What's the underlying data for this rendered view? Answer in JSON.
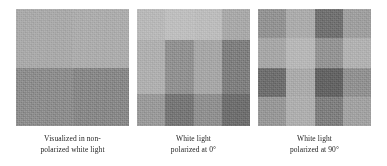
{
  "figure": {
    "panels": [
      {
        "id": "panel-1",
        "name": "nonpolarized-white-light-panel",
        "grid": {
          "cols": 2,
          "rows": 2
        },
        "cells": [
          "#a8a8a8",
          "#ababab",
          "#8b8b8b",
          "#868686"
        ],
        "caption": {
          "line1": "Visualized in non-",
          "line2": "polarized white light"
        }
      },
      {
        "id": "panel-2",
        "name": "white-light-polarized-0deg-panel",
        "grid": {
          "cols": 4,
          "rows": 3
        },
        "cells": [
          "#b7b7b7",
          "#bdbdbd",
          "#bbbbbb",
          "#a7a7a7",
          "#aeaeae",
          "#8f8f8f",
          "#a5a5a5",
          "#7d7d7d",
          "#989898",
          "#757575",
          "#8e8e8e",
          "#6d6d6d"
        ],
        "caption": {
          "line1": "White light",
          "line2": "polarized at 0°"
        }
      },
      {
        "id": "panel-3",
        "name": "white-light-polarized-90deg-panel",
        "grid": {
          "cols": 4,
          "rows": 4
        },
        "cells": [
          "#919191",
          "#aaaaaa",
          "#6f6f6f",
          "#9d9d9d",
          "#a5a5a5",
          "#b6b6b6",
          "#929292",
          "#b0b0b0",
          "#6d6d6d",
          "#a9a9a9",
          "#626262",
          "#8f8f8f",
          "#969696",
          "#adadad",
          "#7d7d7d",
          "#a0a0a0"
        ],
        "caption": {
          "line1": "White light",
          "line2": "polarized at 90°"
        }
      }
    ]
  }
}
